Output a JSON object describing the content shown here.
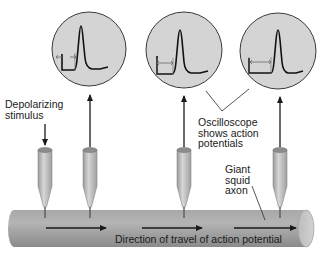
{
  "diagram": {
    "labels": {
      "stimulus": "Depolarizing\nstimulus",
      "oscilloscope": "Oscilloscope\nshows action\npotentials",
      "axon": "Giant\nsquid\naxon",
      "direction": "Direction of travel of action potential"
    },
    "oscilloscopes": [
      {
        "id": "scope-1",
        "cx": 89,
        "cy": 49,
        "r": 37,
        "delay_label": "short latency"
      },
      {
        "id": "scope-2",
        "cx": 184,
        "cy": 50,
        "r": 38,
        "delay_label": "medium latency"
      },
      {
        "id": "scope-3",
        "cx": 278,
        "cy": 51,
        "r": 38,
        "delay_label": "long latency"
      }
    ],
    "electrodes": [
      {
        "id": "stimulating-electrode",
        "x": 45,
        "role": "stimulus"
      },
      {
        "id": "recording-electrode-1",
        "x": 90,
        "role": "recording"
      },
      {
        "id": "recording-electrode-2",
        "x": 184,
        "role": "recording"
      },
      {
        "id": "recording-electrode-3",
        "x": 280,
        "role": "recording"
      }
    ],
    "colors": {
      "scope_fill": "#d4d4d4",
      "scope_stroke": "#3a3a3a",
      "trace": "#111111",
      "axon_fill": "#9a9a9a",
      "axon_highlight": "#c4c4c4",
      "electrode_fill": "#b8b8b8",
      "arrow": "#1a1a1a",
      "text": "#1a1a1a"
    }
  }
}
